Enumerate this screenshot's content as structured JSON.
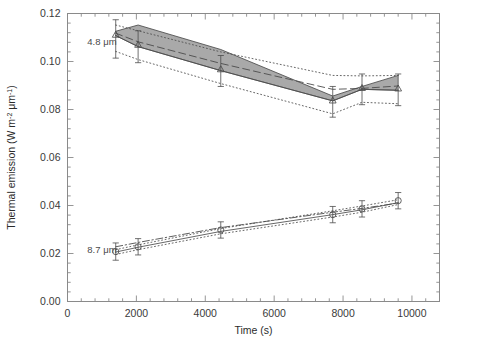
{
  "figure": {
    "kind": "scientific-plot",
    "background": "#ffffff",
    "frame_color": "#8a8a8a",
    "data_color": "#4c4c4c",
    "band_color": "#8c8c8c"
  },
  "chart_data": {
    "type": "line",
    "title": "",
    "xlabel": "Time (s)",
    "ylabel": "Thermal emission (W m⁻² μm⁻¹)",
    "ylabel_parts": {
      "prefix": "Thermal emission  (W m",
      "exp1": "-2",
      "mid": " μm",
      "exp2": "-1",
      "suffix": ")"
    },
    "xlim": [
      0,
      10800
    ],
    "ylim": [
      0.0,
      0.12
    ],
    "xticks": [
      0,
      2000,
      4000,
      6000,
      8000,
      10000
    ],
    "xticklabels": [
      "0",
      "2000",
      "4000",
      "6000",
      "8000",
      "10000"
    ],
    "yticks": [
      0.0,
      0.02,
      0.04,
      0.06,
      0.08,
      0.1,
      0.12
    ],
    "yticklabels": [
      "0.00",
      "0.02",
      "0.04",
      "0.06",
      "0.08",
      "0.10",
      "0.12"
    ],
    "xminor_count": 4,
    "yminor_count": 4,
    "grid": false,
    "legend": "none",
    "annotations": [
      {
        "name": "label-4p8um",
        "text": "4.8 μm",
        "x": 1000,
        "y": 0.1085
      },
      {
        "name": "label-8p7um",
        "text": "8.7 μm",
        "x": 1000,
        "y": 0.0215
      }
    ],
    "series": [
      {
        "name": "4.8 um observations",
        "style": "errorbar",
        "marker": "triangle",
        "x": [
          1400,
          2050,
          4450,
          7700,
          8550,
          9600
        ],
        "values": [
          0.1112,
          0.107,
          0.0968,
          0.0838,
          0.089,
          0.0888
        ],
        "yerr_lo": [
          0.0098,
          0.0075,
          0.0072,
          0.007,
          0.007,
          0.0072
        ],
        "yerr_hi": [
          0.0062,
          0.0058,
          0.0057,
          0.0058,
          0.0058,
          0.006
        ]
      },
      {
        "name": "4.8 um model solid",
        "style": "solid",
        "x": [
          1400,
          2050,
          4450,
          7700,
          8550,
          9600
        ],
        "values": [
          0.1108,
          0.1062,
          0.0962,
          0.0836,
          0.0884,
          0.088
        ]
      },
      {
        "name": "4.8 um model dashed",
        "style": "dashed",
        "x": [
          1400,
          2050,
          4450,
          7700,
          8550,
          9600
        ],
        "values": [
          0.1118,
          0.1082,
          0.0992,
          0.0884,
          0.0888,
          0.0898
        ]
      },
      {
        "name": "4.8 um envelope upper dotted",
        "style": "dotted",
        "x": [
          1400,
          2050,
          4450,
          7700,
          8550,
          9600
        ],
        "values": [
          0.1152,
          0.1128,
          0.104,
          0.0942,
          0.094,
          0.0942
        ]
      },
      {
        "name": "4.8 um envelope lower dotted",
        "style": "dotted",
        "x": [
          1400,
          2050,
          4450,
          7700,
          8550,
          9600
        ],
        "values": [
          0.1042,
          0.1008,
          0.0908,
          0.0782,
          0.083,
          0.0824
        ]
      },
      {
        "name": "4.8 um shaded band upper",
        "style": "band-edge",
        "x": [
          1400,
          2050,
          4450,
          7700,
          8550,
          9600
        ],
        "values": [
          0.1126,
          0.1152,
          0.105,
          0.0856,
          0.0896,
          0.0942
        ]
      },
      {
        "name": "4.8 um shaded band lower",
        "style": "band-edge",
        "x": [
          1400,
          2050,
          4450,
          7700,
          8550,
          9600
        ],
        "values": [
          0.1108,
          0.1062,
          0.0962,
          0.0836,
          0.0884,
          0.088
        ]
      },
      {
        "name": "8.7 um observations",
        "style": "errorbar",
        "marker": "circle",
        "x": [
          1400,
          2050,
          4450,
          7700,
          8550,
          9600
        ],
        "values": [
          0.0208,
          0.0228,
          0.0298,
          0.0362,
          0.0386,
          0.042
        ],
        "yerr_lo": [
          0.0036,
          0.0034,
          0.0034,
          0.0034,
          0.0034,
          0.0034
        ],
        "yerr_hi": [
          0.0036,
          0.0034,
          0.0034,
          0.0034,
          0.0034,
          0.0034
        ]
      },
      {
        "name": "8.7 um model dashdot",
        "style": "dashdot",
        "x": [
          1400,
          2050,
          4450,
          7700,
          8550,
          9600
        ],
        "values": [
          0.0228,
          0.0246,
          0.0308,
          0.0372,
          0.0388,
          0.041
        ]
      },
      {
        "name": "8.7 um model dotted upper",
        "style": "dotted",
        "x": [
          1400,
          2050,
          4450,
          7700,
          8550,
          9600
        ],
        "values": [
          0.0216,
          0.0236,
          0.0304,
          0.0378,
          0.0398,
          0.0424
        ]
      },
      {
        "name": "8.7 um model solid",
        "style": "solid",
        "x": [
          1400,
          2050,
          4450,
          7700,
          8550,
          9600
        ],
        "values": [
          0.0206,
          0.0226,
          0.0292,
          0.0362,
          0.0382,
          0.0412
        ]
      },
      {
        "name": "8.7 um model dotted lower",
        "style": "dotted",
        "x": [
          1400,
          2050,
          4450,
          7700,
          8550,
          9600
        ],
        "values": [
          0.0196,
          0.0216,
          0.0282,
          0.0352,
          0.0372,
          0.0404
        ]
      }
    ]
  }
}
